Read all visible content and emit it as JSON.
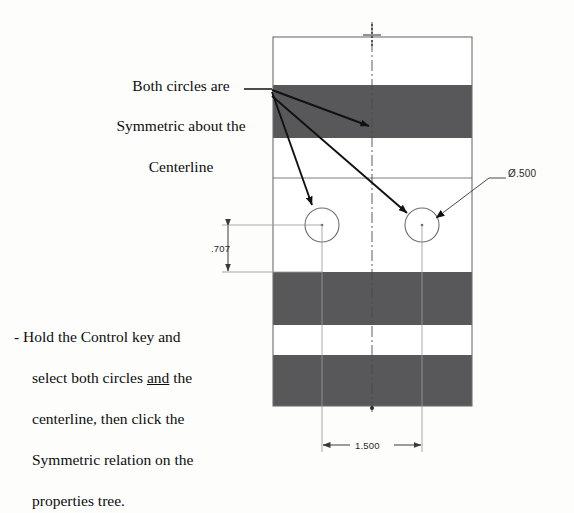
{
  "document": {
    "type": "engineering-sketch-instruction",
    "background_color": "#fdfdfb"
  },
  "notes": {
    "top": {
      "name": "symmetric-callout-note",
      "lines": [
        "Both circles are",
        "Symmetric about the",
        "Centerline"
      ],
      "align": "center"
    },
    "bottom": {
      "name": "instruction-note",
      "lines": [
        "- Hold the Control key and",
        "select both circles",
        "centerline, then click the",
        "Symmetric relation on the",
        "properties tree."
      ],
      "emphasis_word": "and",
      "line2_suffix": " the"
    }
  },
  "dimensions": {
    "diameter": {
      "name": "diameter-callout",
      "symbol": "Ø",
      "value": ".500",
      "label": "Ø.500"
    },
    "vertical": {
      "name": "vertical-dimension",
      "value": ".707",
      "label": ".707"
    },
    "horizontal": {
      "name": "horizontal-dimension",
      "value": "1.500",
      "label": "1.500"
    }
  },
  "geometry": {
    "rectangle": {
      "x": 273,
      "y": 37,
      "width": 199,
      "height": 369,
      "stroke": "#6e6e6e"
    },
    "bands": [
      {
        "y": 37,
        "height": 48,
        "fill": "#ffffff"
      },
      {
        "y": 85,
        "height": 53,
        "fill": "#58585a"
      },
      {
        "y": 138,
        "height": 40,
        "fill": "#ffffff"
      },
      {
        "y": 178,
        "height": 94,
        "fill": "#ffffff"
      },
      {
        "y": 272,
        "height": 53,
        "fill": "#58585a"
      },
      {
        "y": 325,
        "height": 30,
        "fill": "#ffffff"
      },
      {
        "y": 355,
        "height": 51,
        "fill": "#58585a"
      }
    ],
    "internal_lines": [
      {
        "y": 178
      }
    ],
    "centerline": {
      "x": 372,
      "y1": 22,
      "y2": 412,
      "style": "dash-dot",
      "color": "#4b4b4b"
    },
    "circles": [
      {
        "name": "circle-left",
        "cx": 322,
        "cy": 225,
        "r": 17
      },
      {
        "name": "circle-right",
        "cx": 422,
        "cy": 225,
        "r": 17
      }
    ],
    "arrows": [
      {
        "name": "arrow-to-centerline",
        "x1": 272,
        "y1": 92,
        "x2": 369,
        "y2": 126
      },
      {
        "name": "arrow-to-left-circle",
        "x1": 272,
        "y1": 94,
        "x2": 312,
        "y2": 206
      },
      {
        "name": "arrow-to-right-circle",
        "x1": 272,
        "y1": 98,
        "x2": 408,
        "y2": 214
      }
    ],
    "leaders": [
      {
        "name": "diameter-leader",
        "x1": 435,
        "y1": 219,
        "x2": 486,
        "y2": 178,
        "x3": 506,
        "y3": 178
      }
    ],
    "colors": {
      "band_gray": "#58585a",
      "outline": "#6e6e6e",
      "dimension_line": "#7a7a7a",
      "annotation_black": "#111111"
    }
  }
}
